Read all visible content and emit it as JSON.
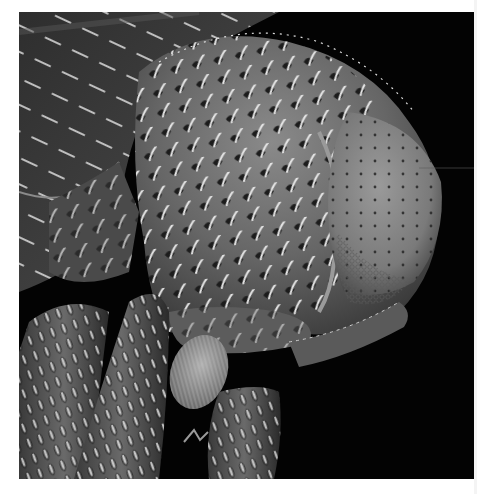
{
  "image": {
    "kind": "scanning electron micrograph",
    "subject": "insect head (beetle/weevil) close-up",
    "palette": {
      "background": "#030303",
      "frame": "#ffffff",
      "cuticle_dark": "#2a2a2a",
      "cuticle_mid": "#6e6e6e",
      "cuticle_light": "#a8a8a8",
      "setae": "#e6e6e6"
    },
    "regions": [
      {
        "name": "head-capsule",
        "description": "large pitted head covered with short curved setae"
      },
      {
        "name": "compound-eye",
        "description": "rounded faceted eye on the right with sparse punctures"
      },
      {
        "name": "pronotum",
        "description": "dark textured plate at upper left"
      },
      {
        "name": "legs",
        "description": "two setose leg segments at lower left"
      },
      {
        "name": "antenna",
        "description": "segmented antenna with hairy club at lower center"
      }
    ]
  }
}
